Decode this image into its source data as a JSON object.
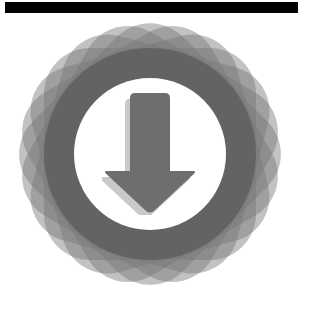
{
  "canvas": {
    "width": 309,
    "height": 320,
    "background_color": "#ffffff"
  },
  "top_bar": {
    "name": "header-bar",
    "color": "#000000",
    "x": 5,
    "y": 2,
    "width": 293,
    "height": 11
  },
  "badge": {
    "title": "download-badge",
    "center_x": 150,
    "center_y": 154,
    "outer_size": 272,
    "petal": {
      "count": 12,
      "size": 212,
      "corner_radius": 46,
      "fill_color": "#787878",
      "fill_opacity": 0.26,
      "rotation_step_degrees": 15
    },
    "ring": {
      "name": "outer-ring",
      "diameter": 212,
      "color": "#636363"
    },
    "core": {
      "name": "inner-circle",
      "diameter": 152,
      "color": "#ffffff"
    },
    "arrow": {
      "name": "download-arrow",
      "fill_color": "#6e6e6e",
      "shadow_color": "#c9c9c9",
      "shadow_offset_x": -5,
      "shadow_offset_y": 6,
      "direction": "down",
      "shaft_width": 40,
      "head_width": 96,
      "total_height": 122,
      "corner_radius": 5
    }
  },
  "icon_names": {
    "download": "download-icon",
    "badge": "rosette-badge-icon"
  }
}
